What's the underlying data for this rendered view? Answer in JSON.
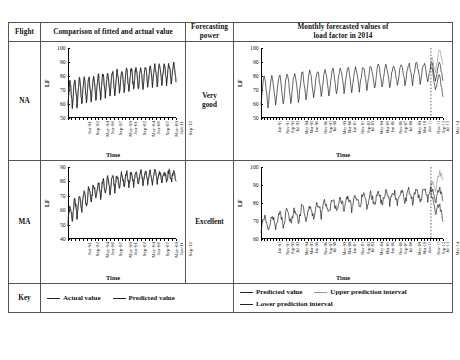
{
  "table": {
    "headers": {
      "flight": "Flight",
      "fitted": "Comparison of fitted and actual value",
      "power": "Forecasting\npower",
      "power_line1": "Forecasting",
      "power_line2": "power",
      "forecast_line1": "Monthly forecasted values of",
      "forecast_line2": "load factor in 2014"
    },
    "rows": [
      {
        "flight": "NA",
        "power": "Very\ngood",
        "power_line1": "Very",
        "power_line2": "good"
      },
      {
        "flight": "MA",
        "power": "Excellent",
        "power_line1": "Excellent",
        "power_line2": ""
      }
    ],
    "key_label": "Key"
  },
  "legend": {
    "left": [
      {
        "label": "Actual value",
        "color": "#222222"
      },
      {
        "label": "Predicted value",
        "color": "#222222"
      }
    ],
    "right": [
      {
        "label": "Predicted value",
        "color": "#222222"
      },
      {
        "label": "Upper prediction interval",
        "color": "#9a9a9a"
      },
      {
        "label": "Lower prediction interval",
        "color": "#222222"
      }
    ]
  },
  "chart_data": [
    {
      "id": "na-fitted",
      "type": "line",
      "title": "",
      "xlabel": "Time",
      "ylabel": "LF",
      "ylim": [
        50,
        100
      ],
      "yticks": [
        50,
        60,
        70,
        80,
        90,
        100
      ],
      "grid": false,
      "legend_position": "external-bottom",
      "xtick_labels": [
        "Jan-91",
        "Sep-92",
        "May-94",
        "Jan-96",
        "Sep-97",
        "May-99",
        "Jan-01",
        "Sep-02",
        "May-04",
        "Jan-06",
        "Sep-07",
        "May-09",
        "Jan-11",
        "Sep-12"
      ],
      "x_range": [
        "Jan-91",
        "Dec-13"
      ],
      "n_points": 276,
      "series": [
        {
          "name": "Actual value",
          "color": "#222222",
          "values": [
            64,
            70,
            76,
            67,
            72,
            78,
            71,
            76,
            60,
            67,
            72,
            55,
            67,
            73,
            78,
            70,
            75,
            81,
            73,
            79,
            63,
            70,
            74,
            57,
            69,
            75,
            80,
            72,
            77,
            83,
            75,
            81,
            65,
            72,
            76,
            59,
            70,
            76,
            81,
            73,
            78,
            84,
            76,
            82,
            66,
            73,
            77,
            60,
            72,
            78,
            83,
            75,
            80,
            86,
            78,
            84,
            68,
            75,
            79,
            62,
            73,
            79,
            84,
            76,
            81,
            87,
            79,
            85,
            69,
            76,
            80,
            63,
            74,
            80,
            85,
            77,
            82,
            88,
            80,
            86,
            70,
            77,
            81,
            64,
            74,
            80,
            85,
            77,
            82,
            88,
            80,
            86,
            70,
            77,
            81,
            64,
            75,
            81,
            86,
            78,
            83,
            89,
            81,
            87,
            71,
            78,
            82,
            65,
            75,
            81,
            86,
            78,
            83,
            89,
            81,
            87,
            71,
            78,
            82,
            65,
            76,
            82,
            87,
            79,
            84,
            90,
            82,
            88,
            72,
            79,
            83,
            66,
            76,
            82,
            87,
            79,
            84,
            90,
            82,
            88,
            72,
            79,
            83,
            66,
            74,
            80,
            85,
            77,
            82,
            88,
            80,
            86,
            70,
            77,
            81,
            64,
            75,
            81,
            86,
            78,
            83,
            89,
            81,
            87,
            71,
            78,
            82,
            65,
            77,
            83,
            88,
            80,
            85,
            91,
            83,
            89,
            73,
            80,
            84,
            67,
            78,
            84,
            89,
            81,
            86,
            92,
            84,
            90,
            74,
            81,
            85,
            68,
            78,
            84,
            89,
            81,
            86,
            92,
            84,
            90,
            74,
            81,
            85,
            68,
            79,
            85,
            90,
            82,
            87,
            92,
            85,
            90,
            75,
            82,
            86,
            69,
            79,
            85,
            90,
            82,
            87,
            92,
            85,
            90,
            75,
            82,
            86,
            69,
            80,
            86,
            91,
            83,
            88,
            93,
            86,
            91,
            76,
            83,
            87,
            70,
            80,
            86,
            91,
            83,
            88,
            93,
            86,
            91,
            76,
            83,
            87,
            70,
            82,
            85,
            88,
            84,
            86,
            87,
            85,
            86,
            83,
            85,
            86,
            83,
            83,
            85,
            87,
            84,
            86,
            87,
            85,
            86,
            84,
            85,
            86,
            84
          ]
        },
        {
          "name": "Predicted value",
          "color": "#222222",
          "values": []
        }
      ]
    },
    {
      "id": "na-forecast",
      "type": "line",
      "title": "",
      "xlabel": "Time",
      "ylabel": "LF",
      "ylim": [
        50,
        100
      ],
      "yticks": [
        50,
        60,
        70,
        80,
        90,
        100
      ],
      "grid": false,
      "forecast_start_label": "Jan-13",
      "xtick_labels": [
        "Jan-91",
        "Nov-91",
        "Sep-92",
        "Jul-93",
        "May-94",
        "Mar-95",
        "Jan-96",
        "Nov-96",
        "Sep-97",
        "Jul-98",
        "May-99",
        "Mar-00",
        "Jan-01",
        "Nov-01",
        "Sep-02",
        "Jul-03",
        "May-04",
        "Mar-05",
        "Jan-06",
        "Nov-06",
        "Sep-07",
        "Jul-08",
        "May-09",
        "Mar-10",
        "Jan-11",
        "Nov-11",
        "Sep-12",
        "Jul-13",
        "May-14"
      ],
      "series": [
        {
          "name": "Predicted value",
          "color": "#222222"
        },
        {
          "name": "Upper prediction interval",
          "color": "#9a9a9a"
        },
        {
          "name": "Lower prediction interval",
          "color": "#222222"
        }
      ]
    },
    {
      "id": "ma-fitted",
      "type": "line",
      "title": "",
      "xlabel": "Time",
      "ylabel": "LF",
      "ylim": [
        40,
        90
      ],
      "yticks": [
        40,
        50,
        60,
        70,
        80,
        90
      ],
      "grid": false,
      "xtick_labels": [
        "Jan-91",
        "Sep-92",
        "May-94",
        "Jan-96",
        "Sep-97",
        "May-99",
        "Jan-01",
        "Sep-02",
        "May-04",
        "Jan-06",
        "Sep-07",
        "May-09",
        "Jan-11",
        "Sep-12"
      ],
      "series": [
        {
          "name": "Actual value",
          "color": "#222222"
        },
        {
          "name": "Predicted value",
          "color": "#222222"
        }
      ]
    },
    {
      "id": "ma-forecast",
      "type": "line",
      "title": "",
      "xlabel": "Time",
      "ylabel": "LF",
      "ylim": [
        60,
        100
      ],
      "yticks": [
        60,
        70,
        80,
        90,
        100
      ],
      "grid": false,
      "forecast_start_label": "Jan-13",
      "xtick_labels": [
        "Jan-91",
        "Nov-91",
        "Sep-92",
        "Jul-93",
        "May-94",
        "Mar-95",
        "Jan-96",
        "Nov-96",
        "Sep-97",
        "Jul-98",
        "May-99",
        "Mar-00",
        "Jan-01",
        "Nov-01",
        "Sep-02",
        "Jul-03",
        "May-04",
        "Mar-05",
        "Jan-06",
        "Nov-06",
        "Sep-07",
        "Jul-08",
        "May-09",
        "Mar-10",
        "Jan-11",
        "Nov-11",
        "Sep-12",
        "Jul-13",
        "May-14"
      ],
      "series": [
        {
          "name": "Predicted value",
          "color": "#222222"
        },
        {
          "name": "Upper prediction interval",
          "color": "#9a9a9a"
        },
        {
          "name": "Lower prediction interval",
          "color": "#222222"
        }
      ]
    }
  ]
}
